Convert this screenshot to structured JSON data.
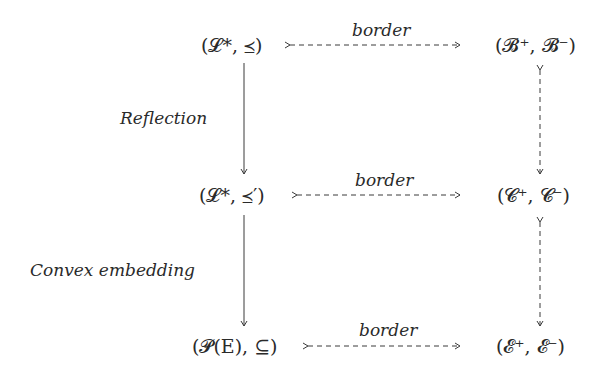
{
  "nodes": {
    "l_star_order": "(𝓛*, ⪯)",
    "b_pair": "(𝓑⁺, 𝓑⁻)",
    "l_star_order_prime": "(𝓛*, ⪯′)",
    "c_pair": "(𝓒⁺, 𝓒⁻)",
    "powerset": "(𝓟(E), ⊆)",
    "e_pair": "(𝓔⁺, 𝓔⁻)"
  },
  "edge_labels": {
    "border_top": "border",
    "border_middle": "border",
    "border_bottom": "border",
    "reflection": "Reflection",
    "convex_embedding": "Convex embedding"
  },
  "colors": {
    "stroke": "#3a3a3a",
    "text": "#2a2a2a",
    "background": "#ffffff"
  }
}
